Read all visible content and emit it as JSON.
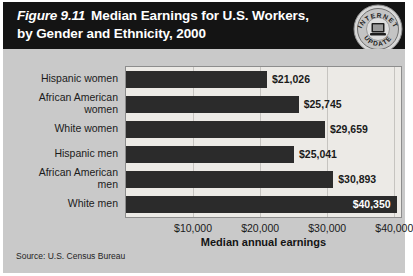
{
  "header": {
    "figure_number": "Figure 9.11",
    "title": "Median Earnings for U.S. Workers,",
    "title_line2": "by Gender and Ethnicity, 2000"
  },
  "seal": {
    "top_text": "INTERNET",
    "bottom_text": "UPDATE",
    "icon": "computer-icon"
  },
  "source": "Source: U.S. Census Bureau",
  "chart_data": {
    "type": "bar",
    "orientation": "horizontal",
    "title": "Median Earnings for U.S. Workers, by Gender and Ethnicity, 2000",
    "xlabel": "Median annual earnings",
    "ylabel": "",
    "xlim": [
      0,
      41000
    ],
    "grid": true,
    "legend": "none",
    "categories": [
      "Hispanic women",
      "African American women",
      "White women",
      "Hispanic men",
      "African American men",
      "White men"
    ],
    "values": [
      21026,
      25745,
      29659,
      25041,
      30893,
      40350
    ],
    "value_labels": [
      "$21,026",
      "$25,745",
      "$29,659",
      "$25,041",
      "$30,893",
      "$40,350"
    ],
    "label_lines": [
      [
        "Hispanic women"
      ],
      [
        "African American",
        "women"
      ],
      [
        "White women"
      ],
      [
        "Hispanic men"
      ],
      [
        "African American",
        "men"
      ],
      [
        "White men"
      ]
    ],
    "xticks": [
      10000,
      20000,
      30000,
      40000
    ],
    "xtick_labels": [
      "$10,000",
      "$20,000",
      "$30,000",
      "$40,000"
    ],
    "bar_color": "#2b2b2b",
    "plot_background": "#eceae6",
    "panel_background": "#c9c9c9",
    "header_background": "#141414"
  }
}
